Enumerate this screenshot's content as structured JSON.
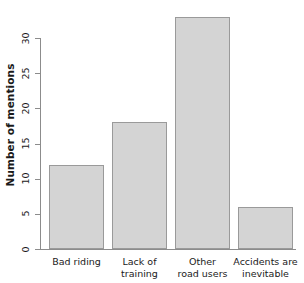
{
  "chart_data": {
    "type": "bar",
    "title": "",
    "xlabel": "",
    "ylabel": "Number of mentions",
    "categories": [
      "Bad riding",
      "Lack of training",
      "Other road users",
      "Accidents are inevitable"
    ],
    "category_lines": [
      [
        "Bad riding",
        ""
      ],
      [
        "Lack of",
        "training"
      ],
      [
        "Other",
        "road users"
      ],
      [
        "Accidents are",
        "inevitable"
      ]
    ],
    "values": [
      12,
      18,
      33,
      6
    ],
    "ylim": [
      0,
      34
    ],
    "yticks": [
      0,
      5,
      10,
      15,
      20,
      25,
      30
    ],
    "ytick_labels": [
      "0",
      "5",
      "10",
      "15",
      "20",
      "25",
      "30"
    ],
    "grid": false,
    "legend": false,
    "colors": {
      "bar_fill": "#d4d4d4",
      "bar_border": "#9a9a9a",
      "axis": "#8c8c8c",
      "text": "#1a1a1a",
      "background": "#ffffff"
    }
  }
}
